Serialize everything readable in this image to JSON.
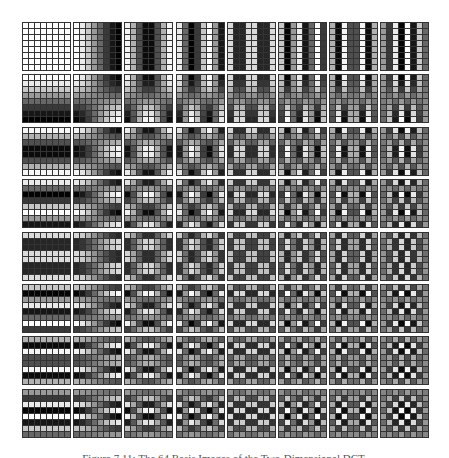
{
  "figure": {
    "caption": "Figure 7.11: The 64 Basis Images of the Two-Dimensional DCT.",
    "grid_rows": 8,
    "grid_cols": 8,
    "block_size": 8,
    "tile_px": 49,
    "pitch_x": 51.2,
    "pitch_y": 52.4,
    "cell_border_color": "#333333",
    "background": "#ffffff"
  }
}
